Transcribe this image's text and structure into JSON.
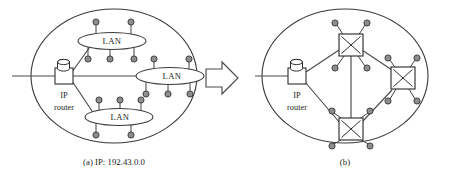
{
  "figure": {
    "background_color": "#ffffff",
    "line_color": "#3a3a3c",
    "host_fill_color": "#8d8d8f",
    "text_color": "#231f20"
  },
  "panel_a": {
    "caption": "(a)  IP: 192.43.0.0",
    "caption_index": "(a)",
    "ip_prefix_label": "IP: 192.43.0.0",
    "router": {
      "label_line1": "IP",
      "label_line2": "router",
      "icon": "cylinder-on-box"
    },
    "uplink_label": "",
    "lans": [
      {
        "label": "LAN",
        "position": "top",
        "hosts_above": 2,
        "hosts_below": 3
      },
      {
        "label": "LAN",
        "position": "middle",
        "hosts_above": 2,
        "hosts_below": 3
      },
      {
        "label": "LAN",
        "position": "bottom",
        "hosts_above": 3,
        "hosts_below": 2
      }
    ],
    "lan_count": 3,
    "host_count": 15
  },
  "transition": {
    "arrow_direction": "right",
    "arrow_style": "outlined-block-arrow"
  },
  "panel_b": {
    "caption": "(b)",
    "caption_index": "(b)",
    "router": {
      "label_line1": "IP",
      "label_line2": "router",
      "icon": "cylinder-on-box"
    },
    "switches": [
      {
        "id": "top",
        "icon": "crossbar-switch",
        "host_count": 4
      },
      {
        "id": "right",
        "icon": "crossbar-switch",
        "host_count": 4
      },
      {
        "id": "bottom",
        "icon": "crossbar-switch",
        "host_count": 4
      }
    ],
    "switch_count": 3,
    "host_count": 12,
    "links": [
      {
        "from": "router",
        "to": "top"
      },
      {
        "from": "router",
        "to": "bottom"
      },
      {
        "from": "top",
        "to": "right"
      },
      {
        "from": "top",
        "to": "bottom"
      },
      {
        "from": "bottom",
        "to": "right"
      }
    ]
  }
}
